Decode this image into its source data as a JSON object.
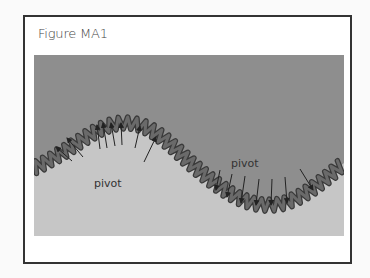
{
  "figure": {
    "title": "Figure MA1",
    "labels": {
      "pivot_left": "pivot",
      "pivot_right": "pivot"
    },
    "colors": {
      "upper_region": "#8e8e8e",
      "lower_region": "#c6c6c6",
      "coil": "#5c5c5c",
      "coil_edge": "#3a3a3a",
      "arrow": "#222222",
      "frame_border": "#333333"
    },
    "arrows": {
      "upward_count": 9,
      "downward_count": 7
    }
  }
}
